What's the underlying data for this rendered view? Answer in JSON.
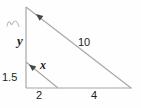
{
  "diagram": {
    "type": "similar-right-triangles",
    "labels": {
      "left_side_upper": "y",
      "left_side_lower": "1.5",
      "small_hypotenuse": "x",
      "large_hypotenuse": "10",
      "base_left_segment": "2",
      "base_right_segment": "4"
    },
    "colors": {
      "line": "#a6a6a6",
      "arrow": "#454545",
      "text": "#1c1c1c",
      "squiggle": "#bdbdbd",
      "background": "#fefefe"
    }
  }
}
